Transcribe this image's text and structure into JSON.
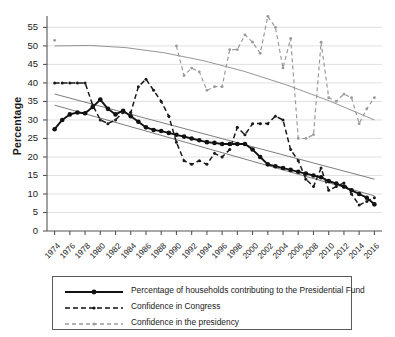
{
  "chart_data": {
    "type": "line",
    "title": "",
    "xlabel": "",
    "ylabel": "Percentage",
    "ylim": [
      0,
      57
    ],
    "yticks": [
      0,
      5,
      10,
      15,
      20,
      25,
      30,
      35,
      40,
      45,
      50,
      55
    ],
    "xlim": [
      1973,
      2017
    ],
    "grid": true,
    "legend_position": "bottom",
    "x": [
      1974,
      1975,
      1976,
      1977,
      1978,
      1979,
      1980,
      1981,
      1982,
      1983,
      1984,
      1985,
      1986,
      1987,
      1988,
      1989,
      1990,
      1991,
      1992,
      1993,
      1994,
      1995,
      1996,
      1997,
      1998,
      1999,
      2000,
      2001,
      2002,
      2003,
      2004,
      2005,
      2006,
      2007,
      2008,
      2009,
      2010,
      2011,
      2012,
      2013,
      2014,
      2015,
      2016
    ],
    "xticks": [
      1974,
      1976,
      1978,
      1980,
      1982,
      1984,
      1986,
      1988,
      1990,
      1992,
      1994,
      1996,
      1998,
      2000,
      2002,
      2004,
      2006,
      2008,
      2010,
      2012,
      2014,
      2016
    ],
    "series": [
      {
        "name": "Percentage of households contributing to the Presidential Fund",
        "style": "solid-marker",
        "color": "#111111",
        "values": [
          27.5,
          30.0,
          31.5,
          32.0,
          31.8,
          33.5,
          35.5,
          33.0,
          31.5,
          32.5,
          31.0,
          29.5,
          28.0,
          27.3,
          27.0,
          26.5,
          26.0,
          25.5,
          25.0,
          24.5,
          24.0,
          23.8,
          23.5,
          23.5,
          23.5,
          23.5,
          22.0,
          20.0,
          18.0,
          17.5,
          17.0,
          16.5,
          16.0,
          15.5,
          15.0,
          14.5,
          13.5,
          12.8,
          12.0,
          11.0,
          10.0,
          9.0,
          7.2
        ]
      },
      {
        "name": "Confidence in Congress",
        "style": "dashed-dark",
        "color": "#1a1a1a",
        "values": [
          40.0,
          40.0,
          40.0,
          40.0,
          40.0,
          34.0,
          30.0,
          29.0,
          30.0,
          32.0,
          32.0,
          39.0,
          41.0,
          38.0,
          35.0,
          31.0,
          24.0,
          19.0,
          18.0,
          19.0,
          18.0,
          21.0,
          20.0,
          22.0,
          28.0,
          26.0,
          29.0,
          29.0,
          29.0,
          31.0,
          30.0,
          22.0,
          19.0,
          14.0,
          12.0,
          17.0,
          11.0,
          12.0,
          13.0,
          10.0,
          7.0,
          8.0,
          9.0
        ]
      },
      {
        "name": "Confidence in the presidency",
        "style": "dashed-light",
        "color": "#9a9a9a",
        "values": [
          51.5,
          null,
          null,
          null,
          null,
          null,
          null,
          null,
          null,
          null,
          null,
          null,
          null,
          null,
          null,
          null,
          50.0,
          42.0,
          44.0,
          43.0,
          38.0,
          39.0,
          39.0,
          49.0,
          49.0,
          53.0,
          51.0,
          48.0,
          58.0,
          55.0,
          44.0,
          52.0,
          25.0,
          25.0,
          26.0,
          51.0,
          36.0,
          35.0,
          37.0,
          36.0,
          29.0,
          33.0,
          36.0
        ]
      }
    ],
    "trendlines": [
      {
        "name": "trend-households",
        "color": "#6e6e6e",
        "from": {
          "x": 1974,
          "y": 37.0
        },
        "to": {
          "x": 2016,
          "y": 14.0
        }
      },
      {
        "name": "trend-congress",
        "color": "#6e6e6e",
        "from": {
          "x": 1974,
          "y": 34.0
        },
        "to": {
          "x": 2016,
          "y": 9.5
        }
      },
      {
        "name": "trend-presidency",
        "color": "#8a8a8a",
        "curve": true,
        "from": {
          "x": 1974,
          "y": 50.0
        },
        "peak": {
          "x": 1992,
          "y": 51.0
        },
        "to": {
          "x": 2016,
          "y": 30.0
        }
      }
    ]
  },
  "legend": {
    "items": [
      {
        "label": "Percentage of households contributing to the Presidential Fund",
        "style": "solid-marker"
      },
      {
        "label": "Confidence in Congress",
        "style": "dashed-dark"
      },
      {
        "label": "Confidence in the presidency",
        "style": "dashed-light"
      }
    ]
  }
}
